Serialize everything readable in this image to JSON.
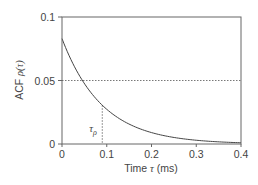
{
  "chart_data": {
    "type": "line",
    "title": "",
    "xlabel": "Time τ (ms)",
    "ylabel": "ACF ρ(τ)",
    "xlim": [
      0,
      0.4
    ],
    "ylim": [
      0,
      0.1
    ],
    "x_ticks": [
      "0",
      "0.1",
      "0.2",
      "0.3",
      "0.4"
    ],
    "y_ticks": [
      "0",
      "0.05",
      "0.1"
    ],
    "grid": false,
    "legend": null,
    "series": [
      {
        "name": "ACF",
        "x": [
          0,
          0.02,
          0.04,
          0.06,
          0.08,
          0.09,
          0.1,
          0.12,
          0.14,
          0.16,
          0.18,
          0.2,
          0.22,
          0.24,
          0.26,
          0.28,
          0.3,
          0.32,
          0.34,
          0.36,
          0.38,
          0.4
        ],
        "values": [
          0.083,
          0.0667,
          0.0535,
          0.043,
          0.0345,
          0.0305,
          0.0277,
          0.0223,
          0.0179,
          0.0144,
          0.0115,
          0.0093,
          0.0074,
          0.006,
          0.0048,
          0.0039,
          0.0031,
          0.0025,
          0.002,
          0.0016,
          0.0013,
          0.001
        ]
      }
    ],
    "annotations": [
      {
        "type": "hline",
        "y": 0.05,
        "style": "dotted"
      },
      {
        "type": "vline",
        "x": 0.09,
        "y_from": 0,
        "y_to": 0.0305,
        "style": "dotted",
        "label": "τρ"
      }
    ]
  },
  "labels": {
    "xlabel_prefix": "Time ",
    "xlabel_symbol": "τ",
    "xlabel_suffix": " (ms)",
    "ylabel_prefix": "ACF ",
    "ylabel_symbol": "ρ(τ)",
    "tau_marker_main": "τ",
    "tau_marker_sub": "ρ"
  }
}
